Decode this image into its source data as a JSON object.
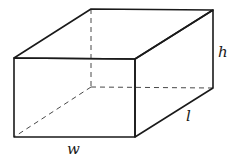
{
  "diagram": {
    "type": "rectangular-prism",
    "labels": {
      "width": "w",
      "length": "l",
      "height": "h"
    },
    "colors": {
      "stroke": "#1a1a1a",
      "hidden_stroke": "#333333",
      "background": "#ffffff"
    }
  }
}
